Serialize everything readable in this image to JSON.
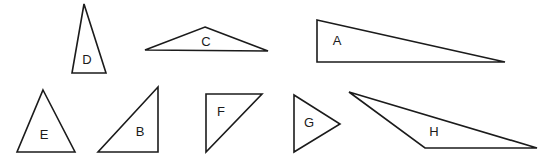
{
  "figure": {
    "background_color": "#ffffff",
    "stroke_color": "#1b1b1b",
    "label_color": "#1b1b1b",
    "width": 545,
    "height": 156,
    "triangles": [
      {
        "id": "D",
        "label": "D",
        "description": "tall narrow isosceles triangle, apex up",
        "points": "84,4 106,73 72,73",
        "label_x": 87,
        "label_y": 61
      },
      {
        "id": "C",
        "label": "C",
        "description": "wide flat obtuse triangle, apex up",
        "points": "205,27 268,51 145,50",
        "label_x": 206,
        "label_y": 43
      },
      {
        "id": "A",
        "label": "A",
        "description": "long right triangle, right angle bottom-left, tip to the right",
        "points": "317,20 505,62 317,62",
        "label_x": 337,
        "label_y": 42
      },
      {
        "id": "E",
        "label": "E",
        "description": "equilateral-like triangle, apex up",
        "points": "43,90 75,152 17,152",
        "label_x": 44,
        "label_y": 136
      },
      {
        "id": "B",
        "label": "B",
        "description": "right triangle, right angle bottom-right",
        "points": "158,87 158,152 98,152",
        "label_x": 140,
        "label_y": 133
      },
      {
        "id": "F",
        "label": "F",
        "description": "right triangle, right angle top-left",
        "points": "206,94 262,94 206,152",
        "label_x": 221,
        "label_y": 113
      },
      {
        "id": "G",
        "label": "G",
        "description": "triangle pointing right",
        "points": "294,95 340,124 294,152",
        "label_x": 309,
        "label_y": 124
      },
      {
        "id": "H",
        "label": "H",
        "description": "very obtuse scalene triangle, long thin, tip at left",
        "points": "349,92 537,148 425,148",
        "label_x": 434,
        "label_y": 133
      }
    ]
  }
}
